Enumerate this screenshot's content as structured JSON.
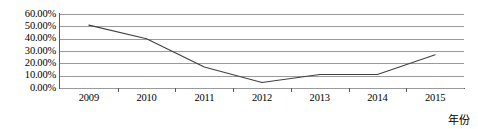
{
  "chart_data": {
    "type": "line",
    "title": "",
    "xlabel": "年份",
    "ylabel": "",
    "categories": [
      "2009",
      "2010",
      "2011",
      "2012",
      "2013",
      "2014",
      "2015"
    ],
    "values": [
      51.0,
      40.0,
      17.0,
      4.5,
      11.0,
      11.0,
      27.0
    ],
    "series": [
      {
        "name": "",
        "values": [
          51.0,
          40.0,
          17.0,
          4.5,
          11.0,
          11.0,
          27.0
        ]
      }
    ],
    "ylim": [
      0,
      60
    ],
    "ytick_labels": [
      "60.00%",
      "50.00%",
      "40.00%",
      "30.00%",
      "20.00%",
      "10.00%",
      "0.00%"
    ],
    "ytick_values": [
      60,
      50,
      40,
      30,
      20,
      10,
      0
    ],
    "grid": true,
    "legend": false,
    "legend_position": "none",
    "markers": false,
    "line_color": "#404040",
    "gridline_color": "#9a9a9a",
    "axis_color": "#5a5a5a",
    "background_color": "#ffffff"
  }
}
